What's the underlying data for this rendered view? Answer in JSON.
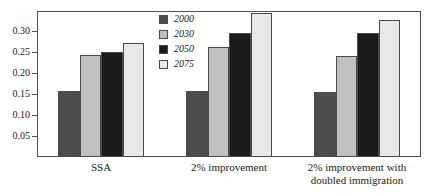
{
  "chart_data": {
    "type": "bar",
    "title": "",
    "subtitle": "",
    "xlabel": "",
    "ylabel": "",
    "categories": [
      "SSA",
      "2% improvement",
      "2% improvement with doubled immigration"
    ],
    "category_lines": [
      [
        "SSA"
      ],
      [
        "2% improvement"
      ],
      [
        "2% improvement with",
        "doubled immigration"
      ]
    ],
    "series": [
      {
        "name": "2000",
        "color": "#4d4d4d",
        "values": [
          0.157,
          0.156,
          0.155
        ]
      },
      {
        "name": "2030",
        "color": "#bfbfbf",
        "values": [
          0.243,
          0.261,
          0.24
        ]
      },
      {
        "name": "2050",
        "color": "#1a1a1a",
        "values": [
          0.251,
          0.295,
          0.294
        ]
      },
      {
        "name": "2075",
        "color": "#e8e8e8",
        "values": [
          0.272,
          0.343,
          0.327
        ]
      }
    ],
    "ylim": [
      0.0,
      0.3475
    ],
    "ytick_values": [
      0.05,
      0.1,
      0.15,
      0.2,
      0.25,
      0.3
    ],
    "ytick_labels": [
      "0.05",
      "0.10",
      "0.15",
      "0.20",
      "0.25",
      "0.30"
    ],
    "grid": false,
    "legend_position": "top-center",
    "bar_edge_color": "#4a4a4a",
    "frame_color": "#555555",
    "background_color": "#ffffff"
  },
  "legend": {
    "entries": [
      {
        "label": "2000",
        "color": "#4d4d4d"
      },
      {
        "label": "2030",
        "color": "#bfbfbf"
      },
      {
        "label": "2050",
        "color": "#1a1a1a"
      },
      {
        "label": "2075",
        "color": "#e8e8e8"
      }
    ]
  }
}
